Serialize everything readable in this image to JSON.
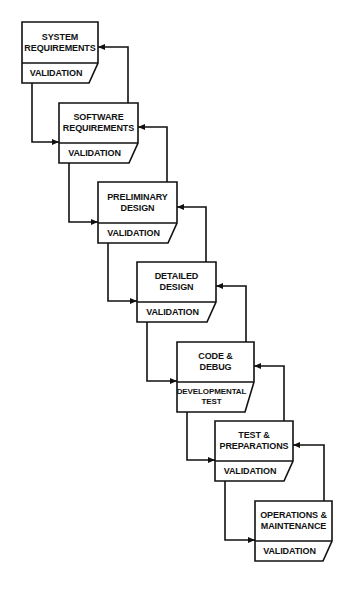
{
  "diagram": {
    "type": "waterfall-flowchart",
    "stages": [
      {
        "id": "system-requirements",
        "title": "SYSTEM REQUIREMENTS",
        "lines": [
          "SYSTEM",
          "REQUIREMENTS"
        ],
        "footer": "VALIDATION",
        "box": {
          "x": 22,
          "y": 22,
          "w": 76,
          "h": 41,
          "fh": 20
        }
      },
      {
        "id": "software-requirements",
        "title": "SOFTWARE REQUIREMENTS",
        "lines": [
          "SOFTWARE",
          "REQUIREMENTS"
        ],
        "footer": "VALIDATION",
        "box": {
          "x": 59,
          "y": 103,
          "w": 79,
          "h": 40,
          "fh": 20
        }
      },
      {
        "id": "preliminary-design",
        "title": "PRELIMINARY DESIGN",
        "lines": [
          "PRELIMINARY",
          "DESIGN"
        ],
        "footer": "VALIDATION",
        "box": {
          "x": 98,
          "y": 182,
          "w": 79,
          "h": 41,
          "fh": 20
        }
      },
      {
        "id": "detailed-design",
        "title": "DETAILED DESIGN",
        "lines": [
          "DETAILED",
          "DESIGN"
        ],
        "footer": "VALIDATION",
        "box": {
          "x": 137,
          "y": 262,
          "w": 79,
          "h": 40,
          "fh": 20
        }
      },
      {
        "id": "code-debug",
        "title": "CODE & DEBUG",
        "lines": [
          "CODE &",
          "DEBUG"
        ],
        "footer": "DEVELOPMENTAL TEST",
        "footer_lines": [
          "DEVELOPMENTAL",
          "TEST"
        ],
        "box": {
          "x": 177,
          "y": 342,
          "w": 77,
          "h": 40,
          "fh": 30
        }
      },
      {
        "id": "test-preparations",
        "title": "TEST & PREPARATIONS",
        "lines": [
          "TEST &",
          "PREPARATIONS"
        ],
        "footer": "VALIDATION",
        "box": {
          "x": 215,
          "y": 421,
          "w": 78,
          "h": 40,
          "fh": 20
        }
      },
      {
        "id": "operations-maintenance",
        "title": "OPERATIONS & MAINTENANCE",
        "lines": [
          "OPERATIONS &",
          "MAINTENANCE"
        ],
        "footer": "VALIDATION",
        "box": {
          "x": 255,
          "y": 501,
          "w": 77,
          "h": 40,
          "fh": 20
        }
      }
    ],
    "connections": {
      "forward": "each stage's footer flows down into the left side of the next stage",
      "feedback": "each stage has a return arrow from its top to the right side of the previous stage"
    },
    "colors": {
      "stroke": "#111111",
      "background": "#ffffff",
      "text": "#111111"
    }
  }
}
